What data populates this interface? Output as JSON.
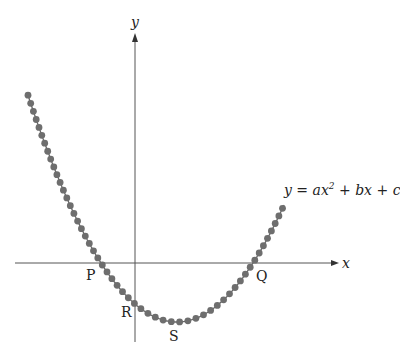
{
  "diagram": {
    "axes": {
      "x_label": "x",
      "y_label": "y"
    },
    "curve_equation": "y = ax² + bx + c",
    "points": [
      {
        "label": "P",
        "description": "left x-intercept"
      },
      {
        "label": "Q",
        "description": "right x-intercept"
      },
      {
        "label": "R",
        "description": "y-intercept"
      },
      {
        "label": "S",
        "description": "vertex (minimum)"
      }
    ],
    "colors": {
      "curve": "#666666",
      "dots": "#6e6e6e",
      "axes": "#555555"
    }
  }
}
